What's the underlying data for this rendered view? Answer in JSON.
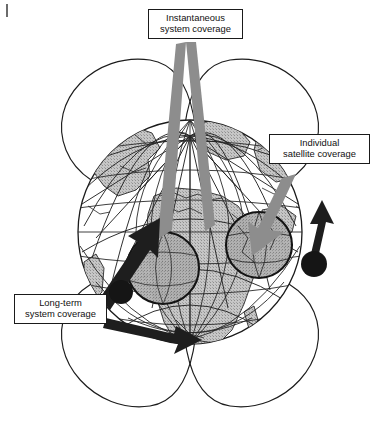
{
  "figure": {
    "name": "satellite-constellation-coverage-diagram",
    "background_color": "#ffffff",
    "width": 380,
    "height": 448
  },
  "callouts": [
    {
      "id": "instantaneous",
      "line1": "Instantaneous",
      "line2": "system coverage",
      "leader_color": "#8d8d8d",
      "leader_style": "thick-gray-double-pointer"
    },
    {
      "id": "individual",
      "line1": "Individual",
      "line2": "satellite coverage",
      "leader_color": "#8d8d8d",
      "leader_style": "thick-gray-arrow"
    },
    {
      "id": "longterm",
      "line1": "Long-term",
      "line2": "system coverage",
      "leader_color": "#1e1e1e",
      "leader_style": "thick-black-arrow"
    }
  ],
  "globe": {
    "center_x": 190,
    "center_y": 232,
    "radius": 112,
    "outline_color": "#1a1a1a",
    "land_fill": "#bdbdbd",
    "ocean_fill": "#ffffff",
    "grid_color": "#2a2a2a",
    "meridian_count": 7,
    "parallel_count": 7
  },
  "orbits": {
    "color": "#1c1c1c",
    "count": 4,
    "description": "intersecting inclined orbital ellipse lobes above and below the globe"
  },
  "coverage_footprints": [
    {
      "id": "footprint-left",
      "cx": 163,
      "cy": 268,
      "r": 36,
      "fill": "#a8a8a8",
      "outline": "#141414"
    },
    {
      "id": "footprint-right",
      "cx": 259,
      "cy": 245,
      "r": 33,
      "fill": "#a8a8a8",
      "outline": "#141414"
    }
  ],
  "satellites": [
    {
      "id": "satellite-left",
      "cx": 121,
      "cy": 292,
      "r": 12,
      "color": "#151515"
    },
    {
      "id": "satellite-right",
      "cx": 314,
      "cy": 264,
      "r": 13,
      "color": "#151515"
    }
  ],
  "colors": {
    "ink": "#1a1a1a",
    "gray_leader": "#8d8d8d",
    "land_gray": "#bdbdbd",
    "footprint_gray": "#a8a8a8",
    "satellite_black": "#151515",
    "paper": "#ffffff"
  }
}
